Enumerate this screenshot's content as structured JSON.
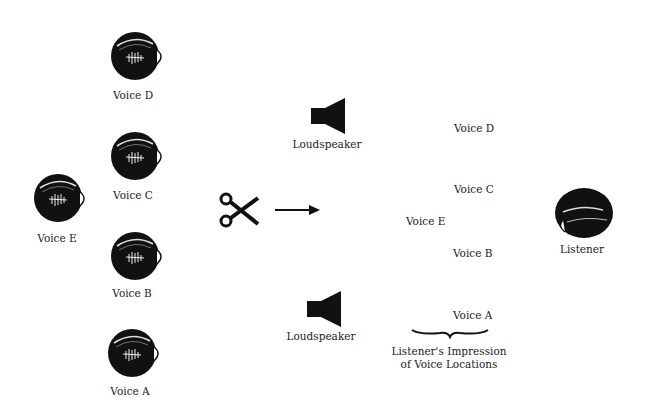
{
  "voices": [
    {
      "id": "D",
      "label": "Voice D"
    },
    {
      "id": "C",
      "label": "Voice C"
    },
    {
      "id": "E",
      "label": "Voice E"
    },
    {
      "id": "B",
      "label": "Voice B"
    },
    {
      "id": "A",
      "label": "Voice A"
    }
  ],
  "splicing": {
    "icon": "scissors-icon",
    "arrow": "right-arrow-icon"
  },
  "loudspeakers": [
    {
      "label": "Loudspeaker"
    },
    {
      "label": "Loudspeaker"
    }
  ],
  "impression": {
    "locations": [
      {
        "label": "Voice D"
      },
      {
        "label": "Voice C"
      },
      {
        "label": "Voice E"
      },
      {
        "label": "Voice B"
      },
      {
        "label": "Voice A"
      }
    ],
    "caption_line1": "Listener's Impression",
    "caption_line2": "of Voice Locations"
  },
  "listener": {
    "label": "Listener"
  },
  "colors": {
    "ink": "#111111",
    "background": "#ffffff"
  }
}
